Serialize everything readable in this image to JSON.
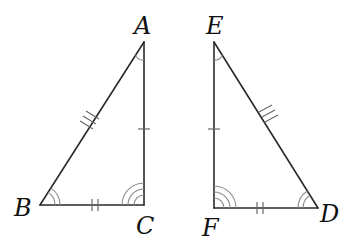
{
  "diagram": {
    "triangles": [
      {
        "name": "ABC",
        "vertices": {
          "A": {
            "label": "A",
            "x": 144,
            "y": 42
          },
          "B": {
            "label": "B",
            "x": 40,
            "y": 205
          },
          "C": {
            "label": "C",
            "x": 144,
            "y": 205
          }
        },
        "side_marks": {
          "AB": 3,
          "AC": 1,
          "BC": 2
        },
        "angle_arcs": {
          "A": 1,
          "B": 2,
          "C": 3
        }
      },
      {
        "name": "EFD",
        "vertices": {
          "E": {
            "label": "E",
            "x": 214,
            "y": 42
          },
          "F": {
            "label": "F",
            "x": 214,
            "y": 208
          },
          "D": {
            "label": "D",
            "x": 318,
            "y": 208
          }
        },
        "side_marks": {
          "ED": 3,
          "EF": 1,
          "FD": 2
        },
        "angle_arcs": {
          "E": 1,
          "D": 2,
          "F": 3
        }
      }
    ],
    "labels": {
      "A": "A",
      "B": "B",
      "C": "C",
      "D": "D",
      "E": "E",
      "F": "F"
    },
    "colors": {
      "line": "#2a2a2a",
      "marks": "#6a6a6a",
      "arcs": "#8a8a8a",
      "text": "#111111",
      "background": "#ffffff"
    }
  }
}
